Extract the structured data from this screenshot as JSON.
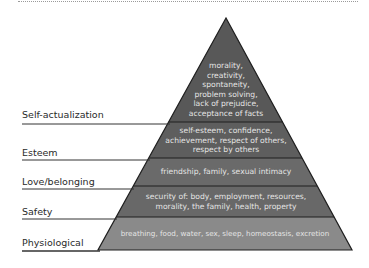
{
  "levels": [
    {
      "label": "Self-actualization",
      "lines": [
        "morality,",
        "creativity,",
        "spontaneity,",
        "problem solving,",
        "lack of prejudice,",
        "acceptance of facts"
      ]
    },
    {
      "label": "Esteem",
      "lines": [
        "self-esteem, confidence,",
        "achievement, respect of others,",
        "respect by others"
      ]
    },
    {
      "label": "Love/belonging",
      "lines": [
        "friendship, family, sexual intimacy"
      ]
    },
    {
      "label": "Safety",
      "lines": [
        "security of: body, employment, resources,",
        "morality, the family, health, property"
      ]
    },
    {
      "label": "Physiological",
      "lines": [
        "breathing, food, water, sex, sleep, homeostasis, excretion"
      ]
    }
  ],
  "colors": {
    "self_actualization": "#585858",
    "esteem": "#5e5e5e",
    "love_belonging": "#6a6a6a",
    "safety": "#686868",
    "physiological": "#8a8a8a",
    "outline": "#1e1e1e"
  }
}
